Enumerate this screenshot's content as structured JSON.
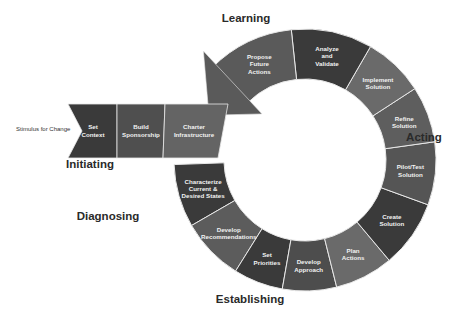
{
  "diagram": {
    "stimulus": "Stimulus for Change",
    "phases": [
      {
        "name": "Initiating",
        "x": 90,
        "y": 168
      },
      {
        "name": "Diagnosing",
        "x": 108,
        "y": 220
      },
      {
        "name": "Establishing",
        "x": 250,
        "y": 303
      },
      {
        "name": "Acting",
        "x": 424,
        "y": 141
      },
      {
        "name": "Learning",
        "x": 246,
        "y": 22
      }
    ],
    "initiating_segments": [
      {
        "label": [
          "Set",
          "Context"
        ]
      },
      {
        "label": [
          "Build",
          "Sponsorship"
        ]
      },
      {
        "label": [
          "Charter",
          "Infrastructure"
        ]
      }
    ],
    "ring_segments": [
      {
        "id": "characterize",
        "label": [
          "Characterize",
          "Current &",
          "Desired States"
        ],
        "color": "#3a3a3a"
      },
      {
        "id": "develop-recommendations",
        "label": [
          "Develop",
          "Recommendations"
        ],
        "color": "#5c5c5c"
      },
      {
        "id": "set-priorities",
        "label": [
          "Set",
          "Priorities"
        ],
        "color": "#3a3a3a"
      },
      {
        "id": "develop-approach",
        "label": [
          "Develop",
          "Approach"
        ],
        "color": "#4d4d4d"
      },
      {
        "id": "plan-actions",
        "label": [
          "Plan",
          "Actions"
        ],
        "color": "#6a6a6a"
      },
      {
        "id": "create-solution",
        "label": [
          "Create",
          "Solution"
        ],
        "color": "#3a3a3a"
      },
      {
        "id": "pilot-test-solution",
        "label": [
          "Pilot/Test",
          "Solution"
        ],
        "color": "#555555"
      },
      {
        "id": "refine-solution",
        "label": [
          "Refine",
          "Solution"
        ],
        "color": "#5e5e5e"
      },
      {
        "id": "implement-solution",
        "label": [
          "Implement",
          "Solution"
        ],
        "color": "#6a6a6a"
      },
      {
        "id": "analyze-validate",
        "label": [
          "Analyze",
          "and",
          "Validate"
        ],
        "color": "#3a3a3a"
      },
      {
        "id": "propose-future-actions",
        "label": [
          "Propose",
          "Future",
          "Actions"
        ],
        "color": "#5a5a5a"
      }
    ],
    "colors": {
      "dark": "#3a3a3a",
      "mid": "#555555",
      "light": "#6a6a6a",
      "divider": "#e8e8e8",
      "text": "#f2f2f2"
    }
  }
}
